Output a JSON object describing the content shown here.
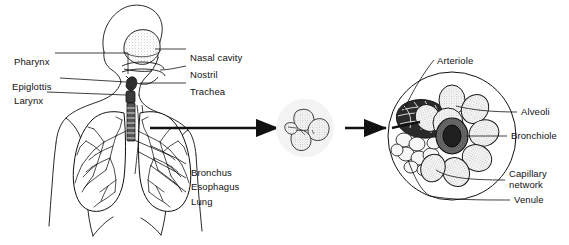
{
  "figure": {
    "background_color": "#ffffff",
    "ink_color": "#111111",
    "stipple_color": "#9a9a9a",
    "halo_color": "#f2f2f2"
  },
  "labels_left": [
    {
      "name": "pharynx",
      "text": "Pharynx",
      "x": 14,
      "y": 56
    },
    {
      "name": "epiglottis",
      "text": "Epiglottis",
      "x": 12,
      "y": 81
    },
    {
      "name": "larynx",
      "text": "Larynx",
      "x": 14,
      "y": 95
    }
  ],
  "labels_right_upper": [
    {
      "name": "nasal-cavity",
      "text": "Nasal cavity",
      "x": 190,
      "y": 52
    },
    {
      "name": "nostril",
      "text": "Nostril",
      "x": 190,
      "y": 69
    },
    {
      "name": "trachea",
      "text": "Trachea",
      "x": 190,
      "y": 86
    }
  ],
  "labels_right_lower": [
    {
      "name": "bronchus",
      "text": "Bronchus",
      "x": 191,
      "y": 167
    },
    {
      "name": "esophagus",
      "text": "Esophagus",
      "x": 191,
      "y": 181
    },
    {
      "name": "lung",
      "text": "Lung",
      "x": 191,
      "y": 196
    }
  ],
  "labels_detail": [
    {
      "name": "arteriole",
      "text": "Arteriole",
      "x": 437,
      "y": 55
    },
    {
      "name": "alveoli",
      "text": "Alveoli",
      "x": 521,
      "y": 110
    },
    {
      "name": "bronchiole",
      "text": "Bronchiole",
      "x": 511,
      "y": 129
    },
    {
      "name": "capillary-network",
      "text": "Capillary network",
      "x": 509,
      "y": 170
    },
    {
      "name": "venule",
      "text": "Venule",
      "x": 514,
      "y": 198
    }
  ],
  "diagram_parts": {
    "torso": "Head and chest profile, anterior view",
    "middle_cluster": "Alveolar sac cluster, magnified once",
    "detail_circle": "Alveolar sac cluster with capillary network, magnified twice"
  },
  "arrows": [
    {
      "name": "arrow-torso-to-cluster",
      "from_x": 150,
      "to_x": 278,
      "y": 128
    },
    {
      "name": "arrow-cluster-to-detail",
      "from_x": 345,
      "to_x": 386,
      "y": 128
    }
  ]
}
